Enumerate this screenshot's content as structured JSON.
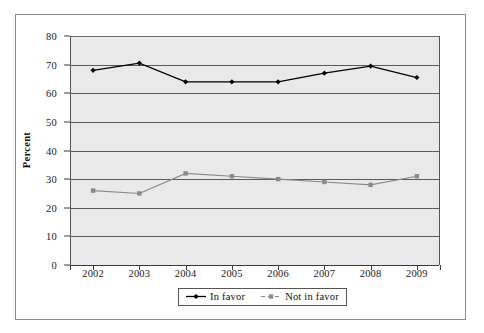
{
  "chart_data": {
    "type": "line",
    "title": "",
    "xlabel": "",
    "ylabel": "Percent",
    "categories": [
      "2002",
      "2003",
      "2004",
      "2005",
      "2006",
      "2007",
      "2008",
      "2009"
    ],
    "ylim": [
      0,
      80
    ],
    "y_ticks": [
      "0",
      "10",
      "20",
      "30",
      "40",
      "50",
      "60",
      "70",
      "80"
    ],
    "grid": true,
    "legend_position": "bottom-center",
    "series": [
      {
        "name": "In favor",
        "color": "#000000",
        "marker": "diamond",
        "values": [
          68,
          70.5,
          64,
          64,
          64,
          67,
          69.5,
          65.5
        ]
      },
      {
        "name": "Not in favor",
        "color": "#8a8a8a",
        "marker": "square",
        "values": [
          26,
          25,
          32,
          31,
          30,
          29,
          28,
          31
        ]
      }
    ]
  },
  "axes": {
    "y_title": "Percent",
    "y_ticks": [
      "80",
      "70",
      "60",
      "50",
      "40",
      "30",
      "20",
      "10",
      "0"
    ],
    "x_ticks": [
      "2002",
      "2003",
      "2004",
      "2005",
      "2006",
      "2007",
      "2008",
      "2009"
    ]
  },
  "legend": {
    "entries": [
      {
        "label": "In favor",
        "color": "#000000"
      },
      {
        "label": "Not in favor",
        "color": "#8a8a8a"
      }
    ]
  },
  "colors": {
    "plot_background": "#e9e9e9",
    "gridline": "#5a5a5a",
    "frame": "#8c8c8c",
    "series_primary": "#000000",
    "series_secondary": "#8a8a8a"
  }
}
